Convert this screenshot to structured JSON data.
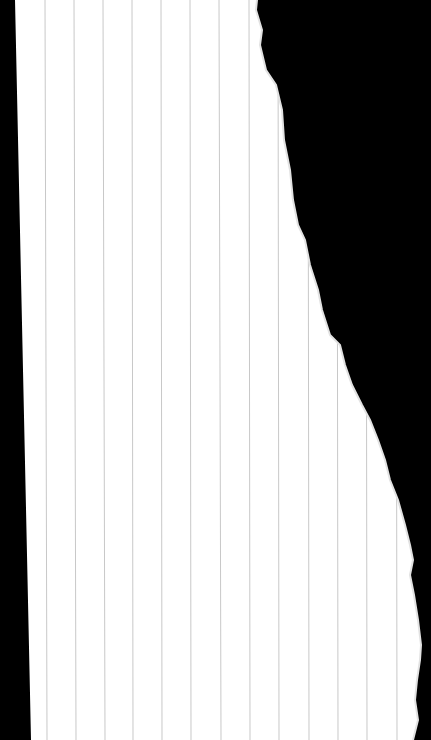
{
  "scene": {
    "description": "Torn sheet of ruled paper on black background",
    "background_color": "#000000",
    "paper_color": "#ffffff",
    "line_color": "#c8c8c8",
    "line_positions_top": [
      45,
      74,
      103,
      132,
      161,
      190,
      219,
      249,
      278,
      308,
      337,
      366,
      396
    ],
    "line_positions_bottom": [
      47,
      76,
      105,
      133,
      162,
      191,
      221,
      250,
      279,
      309,
      338,
      367,
      397
    ],
    "torn_edge": [
      [
        257,
        0
      ],
      [
        256,
        10
      ],
      [
        262,
        30
      ],
      [
        260,
        45
      ],
      [
        266,
        70
      ],
      [
        276,
        85
      ],
      [
        282,
        110
      ],
      [
        284,
        140
      ],
      [
        290,
        170
      ],
      [
        293,
        200
      ],
      [
        298,
        225
      ],
      [
        305,
        240
      ],
      [
        310,
        265
      ],
      [
        318,
        290
      ],
      [
        322,
        310
      ],
      [
        330,
        335
      ],
      [
        340,
        345
      ],
      [
        345,
        365
      ],
      [
        352,
        385
      ],
      [
        362,
        405
      ],
      [
        370,
        420
      ],
      [
        378,
        440
      ],
      [
        385,
        460
      ],
      [
        390,
        480
      ],
      [
        398,
        500
      ],
      [
        405,
        525
      ],
      [
        410,
        545
      ],
      [
        413,
        560
      ],
      [
        410,
        575
      ],
      [
        414,
        595
      ],
      [
        418,
        620
      ],
      [
        421,
        645
      ],
      [
        420,
        660
      ],
      [
        417,
        680
      ],
      [
        415,
        700
      ],
      [
        418,
        720
      ],
      [
        413,
        740
      ]
    ],
    "left_edge": [
      [
        15,
        0
      ],
      [
        31,
        740
      ]
    ]
  }
}
